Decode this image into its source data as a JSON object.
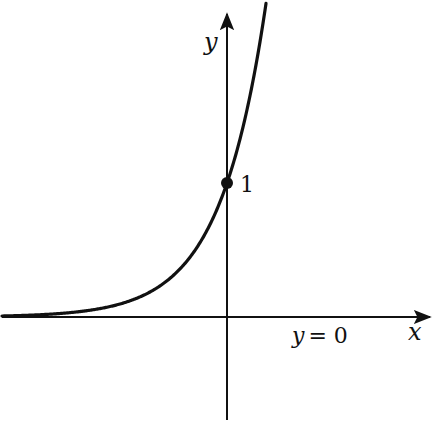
{
  "diagram": {
    "type": "function-graph",
    "function": "exponential",
    "axes": {
      "x_label": "x",
      "y_label": "y"
    },
    "labels": {
      "y_intercept": "1",
      "asymptote_label": "y = 0",
      "asymptote_y": "y",
      "asymptote_eq": "= 0"
    },
    "point": {
      "x": 0,
      "y": 1
    },
    "colors": {
      "ink": "#111111",
      "background": "#ffffff"
    }
  }
}
